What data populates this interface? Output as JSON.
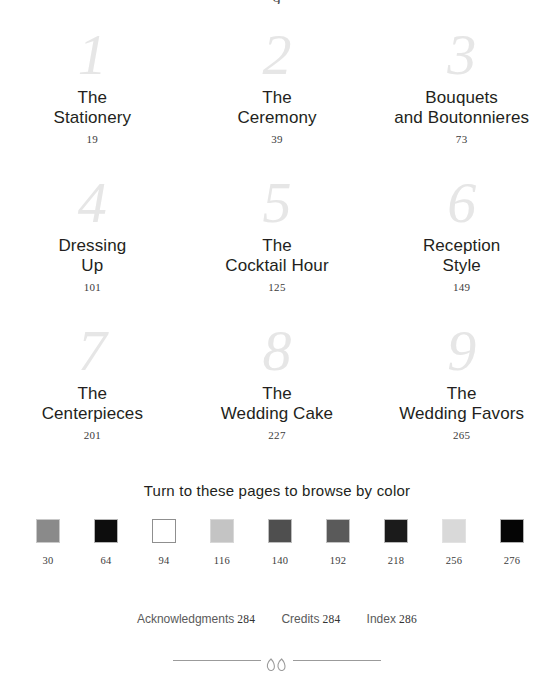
{
  "page": {
    "top_remnant": "9",
    "background": "#ffffff",
    "text_color": "#231f20",
    "numeral_color": "#e6e6e6"
  },
  "chapters": [
    {
      "number": "1",
      "title": "The\nStationery",
      "page": "19"
    },
    {
      "number": "2",
      "title": "The\nCeremony",
      "page": "39"
    },
    {
      "number": "3",
      "title": "Bouquets\nand Boutonnieres",
      "page": "73"
    },
    {
      "number": "4",
      "title": "Dressing\nUp",
      "page": "101"
    },
    {
      "number": "5",
      "title": "The\nCocktail Hour",
      "page": "125"
    },
    {
      "number": "6",
      "title": "Reception\nStyle",
      "page": "149"
    },
    {
      "number": "7",
      "title": "The\nCenterpieces",
      "page": "201"
    },
    {
      "number": "8",
      "title": "The\nWedding Cake",
      "page": "227"
    },
    {
      "number": "9",
      "title": "The\nWedding Favors",
      "page": "265"
    }
  ],
  "color_browse": {
    "heading": "Turn to these pages to browse by color",
    "swatches": [
      {
        "page": "30",
        "color": "#8a8a8a",
        "border": "#c9c9c9"
      },
      {
        "page": "64",
        "color": "#0d0d0d",
        "border": "#b5b5b5"
      },
      {
        "page": "94",
        "color": "#ffffff",
        "border": "#8f8f8f"
      },
      {
        "page": "116",
        "color": "#c4c4c4",
        "border": "#d8d8d8"
      },
      {
        "page": "140",
        "color": "#4f4f4f",
        "border": "#bdbdbd"
      },
      {
        "page": "192",
        "color": "#5a5a5a",
        "border": "#c2c2c2"
      },
      {
        "page": "218",
        "color": "#1b1b1b",
        "border": "#b8b8b8"
      },
      {
        "page": "256",
        "color": "#d9d9d9",
        "border": "#e2e2e2"
      },
      {
        "page": "276",
        "color": "#050505",
        "border": "#b2b2b2"
      }
    ]
  },
  "backmatter": [
    {
      "label": "Acknowledgments",
      "page": "284"
    },
    {
      "label": "Credits",
      "page": "284"
    },
    {
      "label": "Index",
      "page": "286"
    }
  ]
}
